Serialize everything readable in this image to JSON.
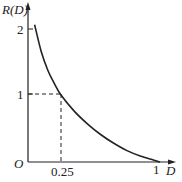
{
  "chart_data": {
    "type": "line",
    "title": "",
    "xlabel": "D",
    "ylabel": "R(D)",
    "origin_label": "O",
    "x_ticks": [
      {
        "value": 0.25,
        "label": "0.25"
      },
      {
        "value": 1,
        "label": "1"
      }
    ],
    "y_ticks": [
      {
        "value": 1,
        "label": "1"
      },
      {
        "value": 2,
        "label": "2"
      }
    ],
    "xlim": [
      0,
      1.05
    ],
    "ylim": [
      0,
      2.3
    ],
    "grid": false,
    "series": [
      {
        "name": "R(D)",
        "x": [
          0.05,
          0.1,
          0.15,
          0.2,
          0.25,
          0.35,
          0.45,
          0.55,
          0.65,
          0.75,
          0.85,
          0.95,
          1.0
        ],
        "y": [
          2.05,
          1.65,
          1.37,
          1.17,
          1.0,
          0.76,
          0.57,
          0.41,
          0.28,
          0.17,
          0.09,
          0.03,
          0.0
        ]
      }
    ],
    "annotations": [
      {
        "type": "dashed-guide",
        "point": [
          0.25,
          1
        ],
        "description": "dashed lines from (0.25,1) to both axes"
      }
    ],
    "colors": {
      "axis": "#222222",
      "curve": "#222222"
    }
  }
}
